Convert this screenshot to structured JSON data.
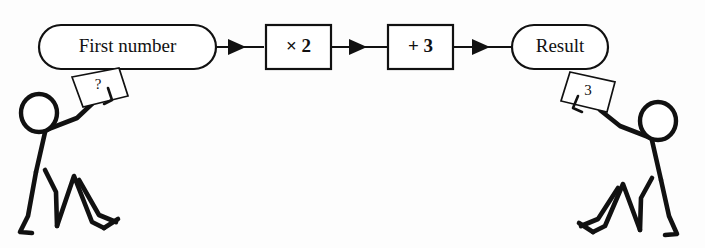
{
  "diagram": {
    "background_color": "#fdfdfd",
    "ink_color": "#111111",
    "nodes": [
      {
        "id": "input",
        "shape": "stadium",
        "label": "First number"
      },
      {
        "id": "times",
        "shape": "rectangle",
        "label": "× 2"
      },
      {
        "id": "plus",
        "shape": "rectangle",
        "label": "+ 3"
      },
      {
        "id": "output",
        "shape": "stadium",
        "label": "Result"
      }
    ],
    "connectors": [
      {
        "id": "arrow-1",
        "from": "input",
        "to": "times",
        "style": "solid-arrow"
      },
      {
        "id": "arrow-2",
        "from": "times",
        "to": "plus",
        "style": "solid-arrow"
      },
      {
        "id": "arrow-3",
        "from": "plus",
        "to": "output",
        "style": "solid-arrow"
      }
    ],
    "figures": [
      {
        "id": "left-figure",
        "pose": "kneeling, arm raised holding card",
        "facing": "right",
        "card": {
          "id": "left-card",
          "label": "?",
          "tilt": "counter-clockwise"
        }
      },
      {
        "id": "right-figure",
        "pose": "kneeling, arm raised holding card",
        "facing": "left",
        "card": {
          "id": "right-card",
          "label": "3",
          "tilt": "clockwise"
        }
      }
    ]
  }
}
